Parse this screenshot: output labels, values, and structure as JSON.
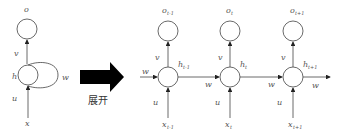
{
  "diagram": {
    "type": "RNN unfolding",
    "arrow_label": "展开",
    "folded": {
      "output": "o",
      "hidden": "h",
      "input": "x",
      "weights": {
        "input": "u",
        "output": "v",
        "recurrent": "w"
      }
    },
    "unfolded": [
      {
        "output": "o",
        "output_sub": "t-1",
        "hidden": "h",
        "hidden_sub": "t-1",
        "input": "x",
        "input_sub": "t-1"
      },
      {
        "output": "o",
        "output_sub": "t",
        "hidden": "h",
        "hidden_sub": "t",
        "input": "x",
        "input_sub": "t"
      },
      {
        "output": "o",
        "output_sub": "t+1",
        "hidden": "h",
        "hidden_sub": "t+1",
        "input": "x",
        "input_sub": "t+1"
      }
    ],
    "weights": {
      "u": "u",
      "v": "v",
      "w": "w"
    }
  }
}
